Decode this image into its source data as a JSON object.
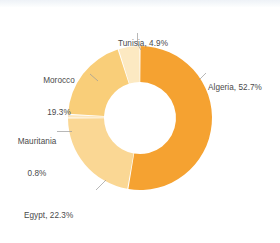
{
  "chart_data": {
    "type": "pie",
    "variant": "donut",
    "title": "",
    "subtitle": "",
    "xlabel": "",
    "ylabel": "",
    "grid": false,
    "legend_position": "callout-labels",
    "unit": "%",
    "start_angle_deg": 0,
    "direction": "clockwise",
    "categories": [
      "Algeria",
      "Egypt",
      "Mauritania",
      "Morocco",
      "Tunisia"
    ],
    "values": [
      52.7,
      22.3,
      0.8,
      19.3,
      4.9
    ],
    "slices": [
      {
        "name": "Algeria",
        "value": 52.7,
        "label": "Algeria, 52.7%",
        "color": "#F5A231",
        "label_position": "right"
      },
      {
        "name": "Egypt",
        "value": 22.3,
        "label": "Egypt, 22.3%",
        "color": "#FAD794",
        "label_position": "bottom-left"
      },
      {
        "name": "Mauritania",
        "value": 0.8,
        "label_line1": "Mauritania",
        "label_line2": "0.8%",
        "color": "#FCE6BC",
        "label_position": "left"
      },
      {
        "name": "Morocco",
        "value": 19.3,
        "label_line1": "Morocco",
        "label_line2": "19.3%",
        "color": "#F9CE79",
        "label_position": "upper-left"
      },
      {
        "name": "Tunisia",
        "value": 4.9,
        "label": "Tunisia, 4.9%",
        "color": "#FCE9C2",
        "label_position": "top"
      }
    ]
  },
  "colors": {
    "background": "#FFFFFF",
    "label_text": "#4A4A4A",
    "leader_line": "#9A9A9A",
    "slice_gap": "#FFFFFF",
    "page_edge": "#EEF2F7"
  },
  "labels": {
    "tunisia": "Tunisia, 4.9%",
    "algeria": "Algeria, 52.7%",
    "morocco_name": "Morocco",
    "morocco_value": "19.3%",
    "mauritania_name": "Mauritania",
    "mauritania_value": "0.8%",
    "egypt": "Egypt, 22.3%"
  }
}
